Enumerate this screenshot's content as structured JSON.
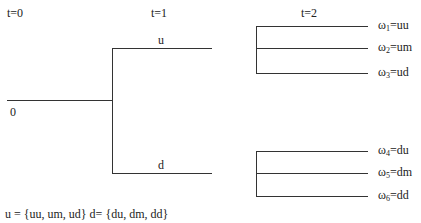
{
  "time_labels": [
    "t=0",
    "t=1",
    "t=2"
  ],
  "root_label": "0",
  "branches": {
    "up": "u",
    "down": "d"
  },
  "outcomes": [
    {
      "symbol": "ω",
      "index": "1",
      "eq": "=uu"
    },
    {
      "symbol": "ω",
      "index": "2",
      "eq": "=um"
    },
    {
      "symbol": "ω",
      "index": "3",
      "eq": "=ud"
    },
    {
      "symbol": "ω",
      "index": "4",
      "eq": "=du"
    },
    {
      "symbol": "ω",
      "index": "5",
      "eq": "=dm"
    },
    {
      "symbol": "ω",
      "index": "6",
      "eq": "=dd"
    }
  ],
  "caption": "u = {uu, um, ud} d= {du, dm, dd}"
}
